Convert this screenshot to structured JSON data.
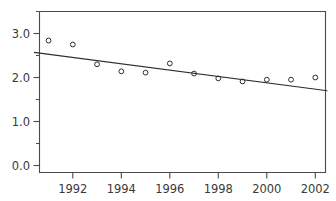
{
  "chart_data": {
    "type": "scatter",
    "title": "",
    "subtitle": "",
    "xlabel": "",
    "ylabel": "",
    "xlim": [
      1990.4,
      1990.4
    ],
    "ylim": [
      0.0,
      3.3
    ],
    "grid": false,
    "legend": null,
    "x": [
      1991,
      1992,
      1993,
      1994,
      1995,
      1996,
      1997,
      1998,
      1999,
      2000,
      2001,
      2002
    ],
    "values": [
      2.84,
      2.75,
      2.3,
      2.14,
      2.11,
      2.32,
      2.09,
      1.98,
      1.91,
      1.95,
      1.95,
      2.0
    ],
    "series": [
      {
        "name": "observations",
        "marker": "open-circle",
        "color": "#2d2d2d",
        "values": [
          2.84,
          2.75,
          2.3,
          2.14,
          2.11,
          2.32,
          2.09,
          1.98,
          1.91,
          1.95,
          1.95,
          2.0
        ]
      },
      {
        "name": "trend-line",
        "type": "line",
        "color": "#2d2d2d",
        "x": [
          1990.4,
          2002.5
        ],
        "values": [
          2.57,
          1.7
        ]
      }
    ],
    "y_ticks": [
      0.0,
      1.0,
      2.0,
      3.0
    ],
    "y_tick_labels": [
      "0.0",
      "1.0",
      "2.0",
      "3.0"
    ],
    "y_minor_ticks": [
      0.5,
      1.5,
      2.5,
      3.25
    ],
    "x_ticks": [
      1992,
      1994,
      1996,
      1998,
      2000,
      2002
    ],
    "x_tick_labels": [
      "1992",
      "1994",
      "1996",
      "1998",
      "2000",
      "2002"
    ]
  },
  "axes": {
    "y": {
      "labels": [
        "3.0",
        "2.0",
        "1.0",
        "0.0"
      ]
    },
    "x": {
      "labels": [
        "1992",
        "1994",
        "1996",
        "1998",
        "2000",
        "2002"
      ]
    }
  }
}
